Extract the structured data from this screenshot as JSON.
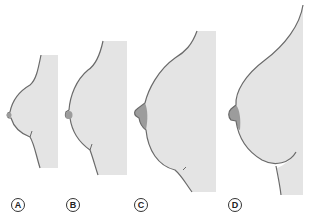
{
  "figure": {
    "type": "anatomical-illustration",
    "colors": {
      "skin": "#e4e4e4",
      "outline": "#6a6a6a",
      "areola": "#9c9c9c",
      "background": "#ffffff"
    },
    "panels": [
      {
        "id": "A",
        "label": "A"
      },
      {
        "id": "B",
        "label": "B"
      },
      {
        "id": "C",
        "label": "C"
      },
      {
        "id": "D",
        "label": "D"
      }
    ]
  }
}
